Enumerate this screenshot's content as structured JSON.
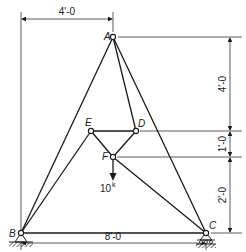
{
  "diagram": {
    "type": "truss",
    "nodes": [
      {
        "id": "A",
        "label": "A"
      },
      {
        "id": "B",
        "label": "B"
      },
      {
        "id": "C",
        "label": "C"
      },
      {
        "id": "D",
        "label": "D"
      },
      {
        "id": "E",
        "label": "E"
      },
      {
        "id": "F",
        "label": "F"
      }
    ],
    "members": [
      [
        "A",
        "B"
      ],
      [
        "A",
        "C"
      ],
      [
        "A",
        "D"
      ],
      [
        "B",
        "C"
      ],
      [
        "B",
        "E"
      ],
      [
        "E",
        "D"
      ],
      [
        "E",
        "F"
      ],
      [
        "D",
        "F"
      ],
      [
        "F",
        "C"
      ]
    ],
    "supports": [
      {
        "node": "B",
        "type": "pin"
      },
      {
        "node": "C",
        "type": "roller"
      }
    ],
    "load": {
      "node": "F",
      "label": "10",
      "unit": "k",
      "direction": "down"
    },
    "dimensions": {
      "top_horizontal": "4'-0",
      "bottom_horizontal": "8'-0",
      "right_vertical": [
        "4'-0",
        "1'-0",
        "2'-0"
      ]
    }
  }
}
